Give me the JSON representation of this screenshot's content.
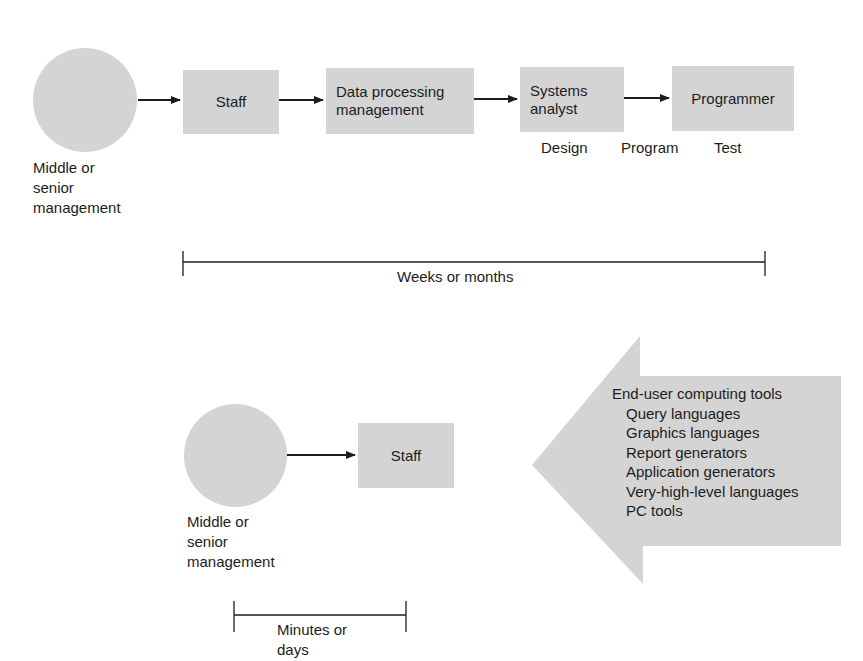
{
  "colors": {
    "shape_fill": "#d4d4d4",
    "line": "#1c1c1c",
    "text": "#1c1c1c",
    "background": "#ffffff"
  },
  "traditional_flow": {
    "origin": {
      "shape": "circle",
      "label_lines": [
        "Middle or",
        "senior",
        "management"
      ]
    },
    "nodes": [
      {
        "label_lines": [
          "Staff"
        ]
      },
      {
        "label_lines": [
          "Data processing",
          "management"
        ]
      },
      {
        "label_lines": [
          "Systems",
          "analyst"
        ]
      },
      {
        "label_lines": [
          "Programmer"
        ]
      }
    ],
    "phases": [
      "Design",
      "Program",
      "Test"
    ],
    "timescale": "Weeks or months"
  },
  "end_user_flow": {
    "origin": {
      "shape": "circle",
      "label_lines": [
        "Middle or",
        "senior",
        "management"
      ]
    },
    "nodes": [
      {
        "label_lines": [
          "Staff"
        ]
      }
    ],
    "timescale_lines": [
      "Minutes or",
      "days"
    ]
  },
  "tools_arrow": {
    "title": "End-user computing tools",
    "items": [
      "Query languages",
      "Graphics languages",
      "Report generators",
      "Application generators",
      "Very-high-level languages",
      "PC tools"
    ]
  }
}
